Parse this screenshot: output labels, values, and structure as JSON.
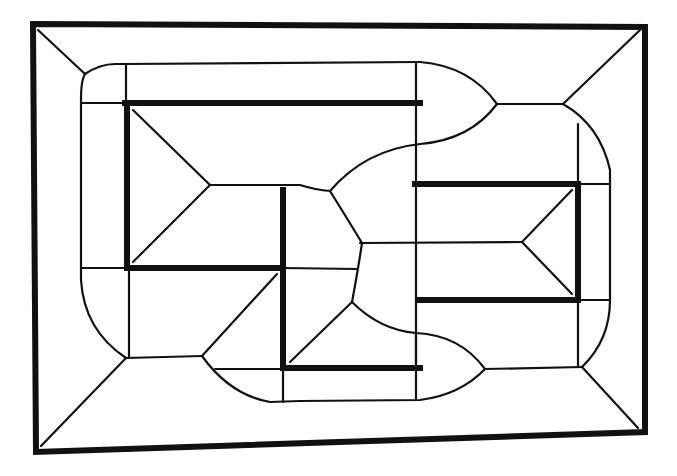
{
  "figure": {
    "title": "",
    "colors": {
      "background": "#ffffff",
      "ink": "#111111"
    },
    "frame": {
      "points": [
        [
          33,
          24
        ],
        [
          645,
          27
        ],
        [
          645,
          432
        ],
        [
          36,
          452
        ]
      ],
      "stroke_width": 6
    },
    "obstacles": [
      {
        "name": "top-bar",
        "x1": 125,
        "y1": 103,
        "x2": 420,
        "y2": 103
      },
      {
        "name": "left-bar",
        "x1": 127,
        "y1": 103,
        "x2": 127,
        "y2": 268
      },
      {
        "name": "mid-left-bar",
        "x1": 127,
        "y1": 268,
        "x2": 283,
        "y2": 268
      },
      {
        "name": "center-vertical-bar",
        "x1": 283,
        "y1": 190,
        "x2": 283,
        "y2": 368
      },
      {
        "name": "bottom-bar",
        "x1": 283,
        "y1": 368,
        "x2": 420,
        "y2": 368
      },
      {
        "name": "right-top-bar",
        "x1": 415,
        "y1": 184,
        "x2": 578,
        "y2": 184
      },
      {
        "name": "right-vertical-bar",
        "x1": 578,
        "y1": 184,
        "x2": 578,
        "y2": 300
      },
      {
        "name": "right-bottom-bar",
        "x1": 418,
        "y1": 300,
        "x2": 578,
        "y2": 300
      }
    ]
  }
}
